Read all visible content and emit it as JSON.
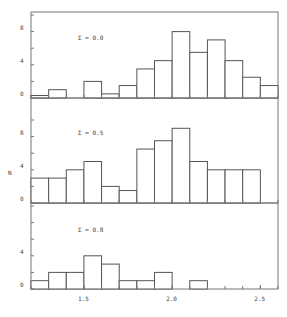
{
  "chart_data": {
    "type": "bar",
    "title": "",
    "xlabel": "",
    "ylabel": "N",
    "bin_edges": [
      1.2,
      1.3,
      1.4,
      1.5,
      1.6,
      1.7,
      1.8,
      1.9,
      2.0,
      2.1,
      2.2,
      2.3,
      2.4,
      2.5,
      2.6
    ],
    "xlim": [
      1.2,
      2.6
    ],
    "x_ticks": [
      1.5,
      2.0,
      2.5
    ],
    "x_tick_labels": [
      "1.5",
      "2.0",
      "2.5"
    ],
    "grid": false,
    "legend": "none",
    "panels": [
      {
        "label": "Σ ≈ 0.0",
        "ylim": [
          0,
          10
        ],
        "y_ticks": [
          0,
          4,
          8
        ],
        "y_tick_labels": [
          "0",
          "4",
          "8"
        ],
        "values": [
          0.3,
          1,
          0,
          2,
          0.5,
          1.5,
          3.5,
          4.5,
          8,
          5.5,
          7,
          4.5,
          2.5,
          1.5
        ]
      },
      {
        "label": "Σ ≈ 0.5",
        "ylim": [
          0,
          10
        ],
        "y_ticks": [
          0,
          4,
          8
        ],
        "y_tick_labels": [
          "0",
          "4",
          "8"
        ],
        "values": [
          3,
          3,
          4,
          5,
          2,
          1.5,
          6.5,
          7.5,
          9,
          5,
          4,
          4,
          4,
          0
        ]
      },
      {
        "label": "Σ ≈ 0.8",
        "ylim": [
          0,
          10
        ],
        "y_ticks": [
          0,
          4
        ],
        "y_tick_labels": [
          "0",
          "4"
        ],
        "values": [
          1,
          2,
          2,
          4,
          3,
          1,
          1,
          2,
          0,
          1,
          0,
          0,
          0,
          0
        ]
      }
    ]
  }
}
